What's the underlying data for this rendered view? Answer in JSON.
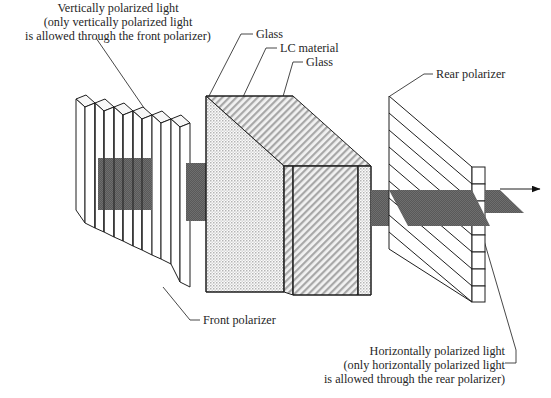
{
  "figure": {
    "background_color": "#ffffff",
    "line_color": "#1f1f1f",
    "beam_color": "#5a5a5a",
    "text_color": "#262626"
  },
  "labels": {
    "vertical_light": {
      "line1": "Vertically polarized light",
      "line2": "(only vertically polarized light",
      "line3": "is allowed through the front polarizer)"
    },
    "glass_front": "Glass",
    "lc_material": "LC material",
    "glass_rear": "Glass",
    "rear_polarizer": "Rear polarizer",
    "front_polarizer": "Front polarizer",
    "horizontal_light": {
      "line1": "Horizontally polarized light",
      "line2": "(only horizontally polarized light",
      "line3": "is allowed through the rear polarizer)"
    }
  },
  "components": {
    "front_polarizer": {
      "name": "Front polarizer",
      "orientation": "vertical-slats",
      "slat_count": 9,
      "transmits": "vertically polarized light"
    },
    "lc_cell": {
      "name": "LC cell",
      "layers": [
        "Glass",
        "LC material",
        "Glass"
      ],
      "front_face_pattern": "stipple-dots",
      "side_face_pattern": "diagonal-hatch"
    },
    "rear_polarizer": {
      "name": "Rear polarizer",
      "orientation": "horizontal-slats",
      "slat_count": 8,
      "transmits": "horizontally polarized light"
    },
    "output_arrow": {
      "name": "output-light-arrow",
      "direction": "right"
    }
  }
}
